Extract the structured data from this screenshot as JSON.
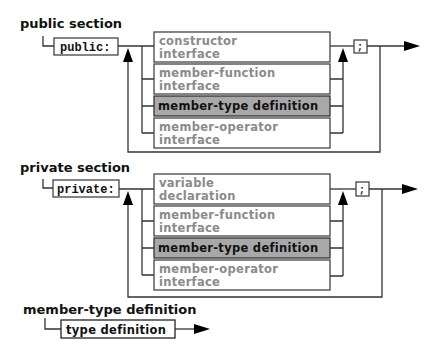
{
  "sections": [
    {
      "title": "public section",
      "keyword": "public:",
      "separator": ";",
      "alternatives": [
        {
          "lines": [
            "constructor",
            "interface"
          ],
          "highlighted": false
        },
        {
          "lines": [
            "member-function",
            "interface"
          ],
          "highlighted": false
        },
        {
          "lines": [
            "member-type definition"
          ],
          "highlighted": true
        },
        {
          "lines": [
            "member-operator",
            "interface"
          ],
          "highlighted": false
        }
      ]
    },
    {
      "title": "private section",
      "keyword": "private:",
      "separator": ";",
      "alternatives": [
        {
          "lines": [
            "variable",
            "declaration"
          ],
          "highlighted": false
        },
        {
          "lines": [
            "member-function",
            "interface"
          ],
          "highlighted": false
        },
        {
          "lines": [
            "member-type definition"
          ],
          "highlighted": true
        },
        {
          "lines": [
            "member-operator",
            "interface"
          ],
          "highlighted": false
        }
      ]
    },
    {
      "title": "member-type definition",
      "item": "type definition"
    }
  ]
}
